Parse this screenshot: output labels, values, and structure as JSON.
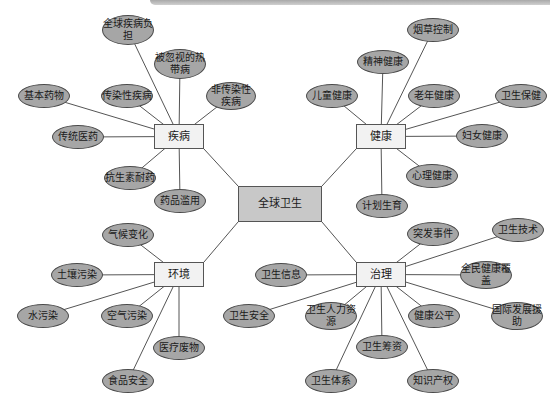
{
  "root": {
    "label": "全球卫生",
    "x": 238,
    "y": 186,
    "w": 84,
    "h": 36
  },
  "colors": {
    "leaf_fill": "#a6a6a6",
    "hub_fill": "#f2f2f2",
    "root_fill": "#c8c8c8",
    "line": "#555555"
  },
  "hubs": [
    {
      "id": "disease",
      "label": "疾病",
      "x": 154,
      "y": 124,
      "w": 50,
      "h": 25,
      "leaves": [
        {
          "label": "全球疾病负担",
          "x": 128,
          "y": 30,
          "w": 52,
          "h": 30
        },
        {
          "label": "被忽视的热带病",
          "x": 180,
          "y": 64,
          "w": 52,
          "h": 30
        },
        {
          "label": "非传染性疾病",
          "x": 231,
          "y": 96,
          "w": 50,
          "h": 28
        },
        {
          "label": "基本药物",
          "x": 44,
          "y": 96,
          "w": 52,
          "h": 24
        },
        {
          "label": "传染性疾病",
          "x": 127,
          "y": 96,
          "w": 52,
          "h": 24
        },
        {
          "label": "传统医药",
          "x": 78,
          "y": 137,
          "w": 52,
          "h": 24
        },
        {
          "label": "抗生素耐药",
          "x": 130,
          "y": 178,
          "w": 52,
          "h": 24
        },
        {
          "label": "药品滥用",
          "x": 180,
          "y": 201,
          "w": 52,
          "h": 24
        }
      ]
    },
    {
      "id": "health",
      "label": "健康",
      "x": 356,
      "y": 124,
      "w": 50,
      "h": 25,
      "leaves": [
        {
          "label": "烟草控制",
          "x": 433,
          "y": 30,
          "w": 52,
          "h": 24
        },
        {
          "label": "精神健康",
          "x": 383,
          "y": 62,
          "w": 52,
          "h": 24
        },
        {
          "label": "儿童健康",
          "x": 332,
          "y": 96,
          "w": 52,
          "h": 24
        },
        {
          "label": "老年健康",
          "x": 434,
          "y": 96,
          "w": 52,
          "h": 24
        },
        {
          "label": "卫生保健",
          "x": 521,
          "y": 96,
          "w": 52,
          "h": 24
        },
        {
          "label": "妇女健康",
          "x": 482,
          "y": 136,
          "w": 52,
          "h": 24
        },
        {
          "label": "心理健康",
          "x": 432,
          "y": 176,
          "w": 52,
          "h": 24
        },
        {
          "label": "计划生育",
          "x": 382,
          "y": 206,
          "w": 52,
          "h": 24
        }
      ]
    },
    {
      "id": "environment",
      "label": "环境",
      "x": 154,
      "y": 262,
      "w": 50,
      "h": 25,
      "leaves": [
        {
          "label": "气候变化",
          "x": 128,
          "y": 235,
          "w": 52,
          "h": 24
        },
        {
          "label": "土壤污染",
          "x": 77,
          "y": 275,
          "w": 52,
          "h": 24
        },
        {
          "label": "水污染",
          "x": 43,
          "y": 316,
          "w": 52,
          "h": 24
        },
        {
          "label": "空气污染",
          "x": 127,
          "y": 316,
          "w": 52,
          "h": 24
        },
        {
          "label": "医疗废物",
          "x": 179,
          "y": 348,
          "w": 52,
          "h": 24
        },
        {
          "label": "食品安全",
          "x": 128,
          "y": 381,
          "w": 52,
          "h": 24
        }
      ]
    },
    {
      "id": "governance",
      "label": "治理",
      "x": 356,
      "y": 262,
      "w": 50,
      "h": 25,
      "leaves": [
        {
          "label": "突发事件",
          "x": 433,
          "y": 234,
          "w": 52,
          "h": 24
        },
        {
          "label": "卫生技术",
          "x": 518,
          "y": 230,
          "w": 52,
          "h": 24
        },
        {
          "label": "卫生信息",
          "x": 281,
          "y": 275,
          "w": 52,
          "h": 24
        },
        {
          "label": "全民健康覆盖",
          "x": 486,
          "y": 275,
          "w": 52,
          "h": 28
        },
        {
          "label": "卫生安全",
          "x": 249,
          "y": 316,
          "w": 52,
          "h": 24
        },
        {
          "label": "卫生人力资源",
          "x": 331,
          "y": 316,
          "w": 52,
          "h": 28
        },
        {
          "label": "健康公平",
          "x": 434,
          "y": 316,
          "w": 52,
          "h": 24
        },
        {
          "label": "国际发展援助",
          "x": 517,
          "y": 316,
          "w": 52,
          "h": 28
        },
        {
          "label": "卫生筹资",
          "x": 382,
          "y": 347,
          "w": 52,
          "h": 24
        },
        {
          "label": "卫生体系",
          "x": 331,
          "y": 381,
          "w": 52,
          "h": 24
        },
        {
          "label": "知识产权",
          "x": 433,
          "y": 381,
          "w": 52,
          "h": 24
        }
      ]
    }
  ]
}
